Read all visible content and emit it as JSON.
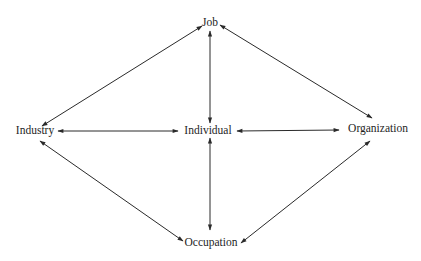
{
  "diagram": {
    "type": "relationship-network",
    "style": {
      "line_color": "#2a2a2a",
      "text_color": "#1e1e1e",
      "background": "#ffffff"
    },
    "nodes": [
      {
        "id": "job",
        "label": "Job",
        "x": 210,
        "y": 24
      },
      {
        "id": "industry",
        "label": "Industry",
        "x": 35,
        "y": 131
      },
      {
        "id": "individual",
        "label": "Individual",
        "x": 208,
        "y": 131
      },
      {
        "id": "organization",
        "label": "Organization",
        "x": 378,
        "y": 129
      },
      {
        "id": "occupation",
        "label": "Occupation",
        "x": 211,
        "y": 243
      }
    ],
    "edges": [
      {
        "from": "industry",
        "to": "job",
        "bidirectional": true
      },
      {
        "from": "job",
        "to": "organization",
        "bidirectional": true
      },
      {
        "from": "job",
        "to": "individual",
        "bidirectional": true
      },
      {
        "from": "industry",
        "to": "individual",
        "bidirectional": true
      },
      {
        "from": "individual",
        "to": "organization",
        "bidirectional": true
      },
      {
        "from": "individual",
        "to": "occupation",
        "bidirectional": true
      },
      {
        "from": "industry",
        "to": "occupation",
        "bidirectional": true
      },
      {
        "from": "occupation",
        "to": "organization",
        "bidirectional": true
      }
    ]
  }
}
